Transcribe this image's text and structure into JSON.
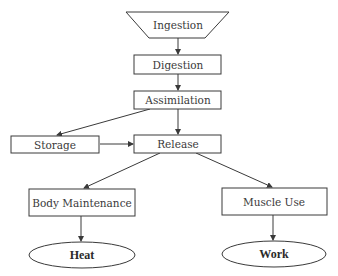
{
  "diagram": {
    "nodes": {
      "ingestion": {
        "label": "Ingestion",
        "shape": "trapezoid"
      },
      "digestion": {
        "label": "Digestion",
        "shape": "rectangle"
      },
      "assimilation": {
        "label": "Assimilation",
        "shape": "rectangle"
      },
      "storage": {
        "label": "Storage",
        "shape": "rectangle"
      },
      "release": {
        "label": "Release",
        "shape": "rectangle"
      },
      "body_maintenance": {
        "label": "Body Maintenance",
        "shape": "rectangle"
      },
      "muscle_use": {
        "label": "Muscle Use",
        "shape": "rectangle"
      },
      "heat": {
        "label": "Heat",
        "shape": "ellipse"
      },
      "work": {
        "label": "Work",
        "shape": "ellipse"
      }
    },
    "edges": [
      {
        "from": "Ingestion",
        "to": "Digestion"
      },
      {
        "from": "Digestion",
        "to": "Assimilation"
      },
      {
        "from": "Assimilation",
        "to": "Storage"
      },
      {
        "from": "Assimilation",
        "to": "Release"
      },
      {
        "from": "Storage",
        "to": "Release"
      },
      {
        "from": "Release",
        "to": "Body Maintenance"
      },
      {
        "from": "Release",
        "to": "Muscle Use"
      },
      {
        "from": "Body Maintenance",
        "to": "Heat"
      },
      {
        "from": "Muscle Use",
        "to": "Work"
      }
    ],
    "colors": {
      "stroke": "#3a3a3a",
      "fill": "#ffffff",
      "text": "#3a3a3a"
    }
  }
}
